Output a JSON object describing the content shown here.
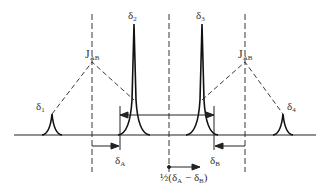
{
  "figure": {
    "type": "nmr-ab-spectrum",
    "colors": {
      "line": "#222222",
      "text": "#333333",
      "background": "#ffffff"
    },
    "peaks": [
      {
        "id": "delta1",
        "label": "δ",
        "sub": "1",
        "x": 52,
        "height": "small"
      },
      {
        "id": "delta2",
        "label": "δ",
        "sub": "2",
        "x": 134,
        "height": "tall"
      },
      {
        "id": "delta3",
        "label": "δ",
        "sub": "3",
        "x": 202,
        "height": "tall"
      },
      {
        "id": "delta4",
        "label": "δ",
        "sub": "4",
        "x": 283,
        "height": "small"
      }
    ],
    "coupling_labels": [
      {
        "id": "jab-left",
        "label": "J",
        "sub": "AB"
      },
      {
        "id": "jab-right",
        "label": "J",
        "sub": "AB"
      }
    ],
    "shift_labels": {
      "deltaA": {
        "label": "δ",
        "sub": "A"
      },
      "deltaB": {
        "label": "δ",
        "sub": "B"
      }
    },
    "center_label": {
      "prefix": "½(δ",
      "sub1": "A",
      "minus": " − δ",
      "sub2": "B",
      "suffix": ")"
    }
  }
}
